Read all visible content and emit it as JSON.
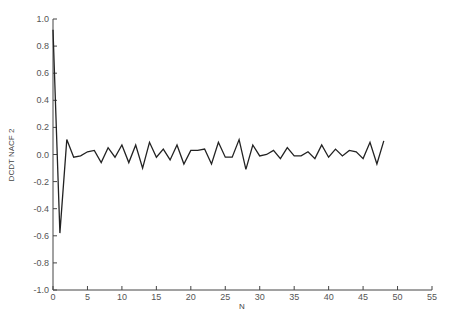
{
  "chart_data": {
    "type": "line",
    "title": "",
    "xlabel": "N",
    "ylabel": "DCDT NACF 2",
    "xlim": [
      0,
      55
    ],
    "ylim": [
      -1.0,
      1.0
    ],
    "grid": false,
    "legend": null,
    "x_ticks": [
      0,
      5,
      10,
      15,
      20,
      25,
      30,
      35,
      40,
      45,
      50,
      55
    ],
    "y_ticks": [
      1.0,
      0.8,
      0.6,
      0.4,
      0.2,
      0.0,
      -0.2,
      -0.4,
      -0.6,
      -0.8,
      -1.0
    ],
    "y_tick_labels": [
      "1.0",
      "0.8",
      "0.6",
      "0.4",
      "0.2",
      "0.0",
      "-0.2",
      "-0.4",
      "-0.6",
      "-0.8",
      "-1.0"
    ],
    "series": [
      {
        "name": "DCDT NACF 2",
        "color": "#222222",
        "x": [
          0,
          1,
          2,
          3,
          4,
          5,
          6,
          7,
          8,
          9,
          10,
          11,
          12,
          13,
          14,
          15,
          16,
          17,
          18,
          19,
          20,
          21,
          22,
          23,
          24,
          25,
          26,
          27,
          28,
          29,
          30,
          31,
          32,
          33,
          34,
          35,
          36,
          37,
          38,
          39,
          40,
          41,
          42,
          43,
          44,
          45,
          46,
          47,
          48
        ],
        "values": [
          0.92,
          -0.58,
          0.11,
          -0.02,
          -0.01,
          0.02,
          0.03,
          -0.06,
          0.05,
          -0.02,
          0.07,
          -0.06,
          0.07,
          -0.1,
          0.09,
          -0.02,
          0.04,
          -0.04,
          0.07,
          -0.07,
          0.03,
          0.03,
          0.04,
          -0.07,
          0.09,
          -0.02,
          -0.02,
          0.11,
          -0.11,
          0.07,
          -0.01,
          0.0,
          0.03,
          -0.03,
          0.05,
          -0.01,
          -0.01,
          0.02,
          -0.03,
          0.07,
          -0.02,
          0.04,
          -0.01,
          0.03,
          0.02,
          -0.03,
          0.09,
          -0.07,
          0.1
        ]
      }
    ],
    "caption": "(caption cut off at bottom edge — not legible)"
  },
  "labels": {
    "x_axis_title": "N",
    "y_axis_title": "DCDT NACF 2"
  }
}
